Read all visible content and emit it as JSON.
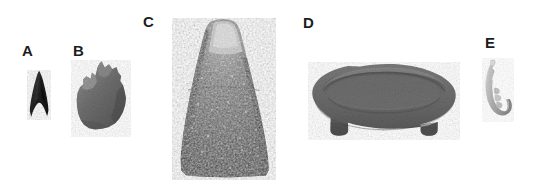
{
  "figure": {
    "background_color": "#ffffff",
    "width": 536,
    "height": 189
  },
  "labels": [
    {
      "text": "A",
      "x": 22,
      "y": 43
    },
    {
      "text": "B",
      "x": 73,
      "y": 43
    },
    {
      "text": "C",
      "x": 143,
      "y": 14
    },
    {
      "text": "D",
      "x": 303,
      "y": 15
    },
    {
      "text": "E",
      "x": 485,
      "y": 35
    }
  ],
  "artifacts": [
    {
      "id": "a",
      "label": "A",
      "name": "projectile-point",
      "description": "small dark triangular notched-base projectile point",
      "color": "#2b2b2b",
      "x": 26,
      "y": 70,
      "width": 26,
      "height": 50
    },
    {
      "id": "b",
      "label": "B",
      "name": "stone-fragment",
      "description": "gray angular stone fragment with jagged upper edge",
      "color": "#6e6e6e",
      "x": 71,
      "y": 62,
      "width": 60,
      "height": 74
    },
    {
      "id": "c",
      "label": "C",
      "name": "stone-celt",
      "description": "large conical trapezoidal ground-stone celt with rounded poll",
      "color": "#5a5a5a",
      "x": 174,
      "y": 20,
      "width": 100,
      "height": 158
    },
    {
      "id": "d",
      "label": "D",
      "name": "stone-bowl",
      "description": "oval footed stone bowl / mortar with interior basin",
      "color": "#6b6b6b",
      "x": 310,
      "y": 64,
      "width": 148,
      "height": 74
    },
    {
      "id": "e",
      "label": "E",
      "name": "bone-fishhook",
      "description": "light-colored curved bone or shell fishhook with barbed shank",
      "color": "#b4b4b4",
      "x": 482,
      "y": 60,
      "width": 30,
      "height": 68
    }
  ]
}
